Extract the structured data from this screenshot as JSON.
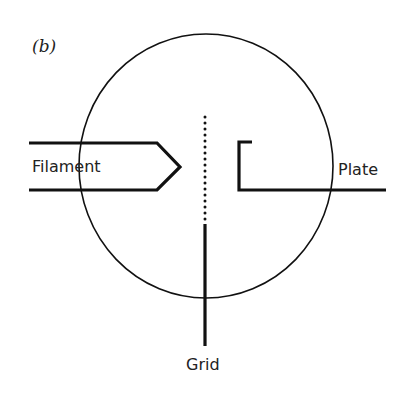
{
  "figure": {
    "panel_label": "(b)",
    "labels": {
      "filament": "Filament",
      "plate": "Plate",
      "grid": "Grid"
    },
    "colors": {
      "stroke": "#111111",
      "background": "#ffffff"
    }
  }
}
